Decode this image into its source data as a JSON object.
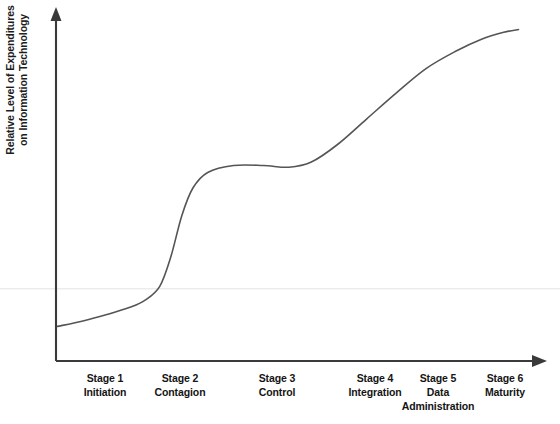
{
  "chart_data": {
    "type": "line",
    "title": "",
    "subtitle": "",
    "xlabel": "",
    "ylabel": "Relative Level of Expenditures on Information Technology",
    "ylabel_lines": [
      "Relative Level of Expenditures",
      "on Information Technology"
    ],
    "grid": false,
    "legend": "none",
    "axis_style": "arrow-axes",
    "xlim": [
      0,
      6.5
    ],
    "ylim": [
      0,
      1.0
    ],
    "x_tick_labels": [],
    "y_tick_labels": [],
    "categories": [
      "Stage 1 Initiation",
      "Stage 2 Contagion",
      "Stage 3 Control",
      "Stage 4 Integration",
      "Stage 5 Data Administration",
      "Stage 6 Maturity"
    ],
    "series": [
      {
        "name": "Relative Level of Expenditures on Information Technology",
        "color": "#555555",
        "description": "Double S-curve: low flat start, steep rise through Stage 2, plateau across Stages 3-4, second steep rise through Stage 5, levelling off at Stage 6",
        "x": [
          0.02,
          0.35,
          0.7,
          1.0,
          1.2,
          1.4,
          1.55,
          1.7,
          1.85,
          2.05,
          2.4,
          2.8,
          3.15,
          3.45,
          3.8,
          4.2,
          4.6,
          5.0,
          5.4,
          5.75,
          6.05,
          6.25
        ],
        "values": [
          0.1,
          0.115,
          0.135,
          0.155,
          0.175,
          0.215,
          0.3,
          0.42,
          0.5,
          0.545,
          0.565,
          0.565,
          0.56,
          0.575,
          0.625,
          0.7,
          0.775,
          0.845,
          0.895,
          0.93,
          0.95,
          0.958
        ]
      }
    ],
    "reference_line": {
      "orientation": "horizontal",
      "y": 0.21,
      "color": "#e2e2e2",
      "label": ""
    }
  },
  "axis": {
    "y_axis_name": "y-axis-arrow",
    "x_axis_name": "x-axis-arrow",
    "color": "#3a3a3a"
  },
  "x_labels": [
    {
      "stage": "Stage 1",
      "name": "Initiation",
      "name2": "",
      "cx": 105
    },
    {
      "stage": "Stage 2",
      "name": "Contagion",
      "name2": "",
      "cx": 180
    },
    {
      "stage": "Stage 3",
      "name": "Control",
      "name2": "",
      "cx": 277
    },
    {
      "stage": "Stage 4",
      "name": "Integration",
      "name2": "",
      "cx": 375
    },
    {
      "stage": "Stage 5",
      "name": "Data",
      "name2": "Administration",
      "cx": 438
    },
    {
      "stage": "Stage 6",
      "name": "Maturity",
      "name2": "",
      "cx": 505
    }
  ],
  "colors": {
    "curve": "#555555",
    "axis": "#3a3a3a",
    "reference_line": "#e2e2e2",
    "text": "#141414",
    "background": "#ffffff"
  }
}
